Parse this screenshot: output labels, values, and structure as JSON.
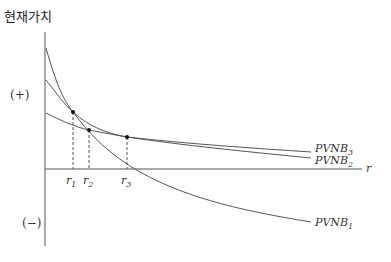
{
  "diagram": {
    "y_axis_label": "현재가치",
    "positive_label": "(+)",
    "negative_label": "(−)",
    "x_axis_label": "r",
    "curves": [
      {
        "name": "PVNB",
        "sub": "1"
      },
      {
        "name": "PVNB",
        "sub": "2"
      },
      {
        "name": "PVNB",
        "sub": "3"
      }
    ],
    "rates": [
      {
        "name": "r",
        "sub": "1"
      },
      {
        "name": "r",
        "sub": "2"
      },
      {
        "name": "r",
        "sub": "3"
      }
    ],
    "line_color": "#555555"
  }
}
